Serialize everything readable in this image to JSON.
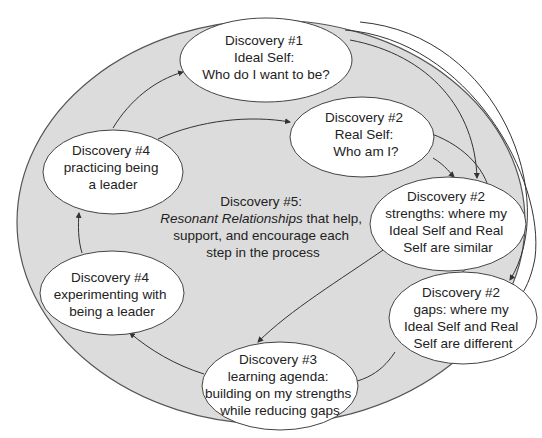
{
  "diagram": {
    "colors": {
      "outer_fill": "#dcdcdc",
      "outer_stroke": "#555555",
      "node_fill": "#ffffff",
      "node_stroke": "#444444",
      "arrow": "#333333",
      "text": "#222222"
    },
    "center": {
      "line1": "Discovery #5:",
      "line2_italic": "Resonant Relationships",
      "line2_rest": " that help,",
      "line3": "support, and encourage each",
      "line4": "step in the process"
    },
    "nodes": [
      {
        "id": "ideal-self",
        "lines": [
          "Discovery #1",
          "Ideal Self:",
          "Who do I want to be?"
        ]
      },
      {
        "id": "real-self",
        "lines": [
          "Discovery #2",
          "Real Self:",
          "Who am I?"
        ]
      },
      {
        "id": "strengths",
        "lines": [
          "Discovery #2",
          "strengths: where my",
          "Ideal Self and Real",
          "Self are similar"
        ]
      },
      {
        "id": "gaps",
        "lines": [
          "Discovery #2",
          "gaps: where my",
          "Ideal Self and Real",
          "Self are different"
        ]
      },
      {
        "id": "learning-agenda",
        "lines": [
          "Discovery #3",
          "learning agenda:",
          "building on my strengths",
          "while reducing gaps"
        ]
      },
      {
        "id": "experimenting",
        "lines": [
          "Discovery #4",
          "experimenting with",
          "being a leader"
        ]
      },
      {
        "id": "practicing",
        "lines": [
          "Discovery #4",
          "practicing being",
          "a leader"
        ]
      }
    ],
    "edges": [
      {
        "from": "practicing",
        "to": "ideal-self"
      },
      {
        "from": "practicing",
        "to": "real-self"
      },
      {
        "from": "real-self",
        "to": "strengths"
      },
      {
        "from": "real-self",
        "to": "gaps"
      },
      {
        "from": "ideal-self",
        "to": "strengths"
      },
      {
        "from": "ideal-self",
        "to": "gaps"
      },
      {
        "from": "strengths",
        "to": "learning-agenda"
      },
      {
        "from": "gaps",
        "to": "learning-agenda"
      },
      {
        "from": "learning-agenda",
        "to": "experimenting"
      },
      {
        "from": "experimenting",
        "to": "practicing"
      }
    ]
  }
}
